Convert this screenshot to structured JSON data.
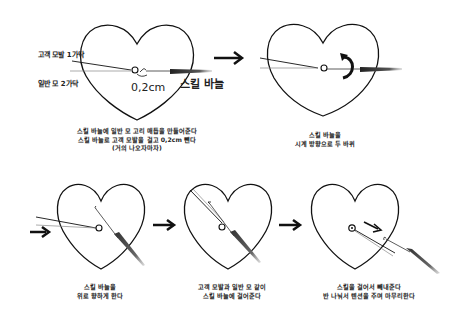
{
  "steps": [
    {
      "step": 1,
      "labels": {
        "customer_hair": "고객 모발 1가닥",
        "regular_hair": "일반 모 2가닥",
        "measurement": "0,2cm",
        "needle": "스킬 바늘"
      },
      "caption": [
        "스킬 바늘에 일반 모 고리 매듭을 만들어준다",
        "스킬 바늘로 고객 모발을 걸고 0,2cm 뺀다",
        "(거의 나오자마자)"
      ]
    },
    {
      "step": 2,
      "caption": [
        "스킬 바늘을",
        "시계 방향으로 두 바퀴"
      ]
    },
    {
      "step": 3,
      "caption": [
        "스킬 바늘을",
        "위로 향하게 한다"
      ]
    },
    {
      "step": 4,
      "caption": [
        "고객 모발과 일반 모 같이",
        "스킬 바늘에 걸어준다"
      ]
    },
    {
      "step": 5,
      "caption": [
        "스킬을 걸어서 빼내준다",
        "반 나눠서 텐션을 주며 마무리한다"
      ]
    }
  ],
  "icons": {
    "step_arrow": "right-arrow",
    "rotate": "clockwise-rotate-arrow",
    "pull": "pull-arrow"
  },
  "colors": {
    "line": "#111111",
    "thread_light": "#888888",
    "needle_dark": "#333333",
    "background": "#ffffff"
  }
}
